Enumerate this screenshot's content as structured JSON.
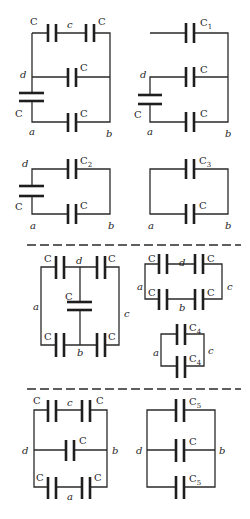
{
  "figure": {
    "type": "capacitor-network-reduction",
    "sections": [
      {
        "id": "section-1",
        "circuits": [
          {
            "id": "circuit-1",
            "labels": {
              "top_left_cap": "C",
              "top_node": "c",
              "top_right_cap": "C",
              "middle_cap": "C",
              "left_node": "d",
              "left_cap": "C",
              "bottom_cap": "C",
              "node_a": "a",
              "node_b": "b"
            }
          },
          {
            "id": "circuit-2",
            "labels": {
              "top_cap": "C",
              "top_cap_sub": "1",
              "left_node": "d",
              "middle_cap": "C",
              "left_cap": "C",
              "bottom_cap": "C",
              "node_a": "a",
              "node_b": "b"
            }
          },
          {
            "id": "circuit-3",
            "labels": {
              "left_node": "d",
              "top_cap": "C",
              "top_cap_sub": "2",
              "left_cap": "C",
              "bottom_cap": "C",
              "node_a": "a",
              "node_b": "b"
            }
          },
          {
            "id": "circuit-4",
            "labels": {
              "top_cap": "C",
              "top_cap_sub": "3",
              "bottom_cap": "C",
              "node_a": "a",
              "node_b": "b"
            }
          }
        ]
      },
      {
        "id": "section-2",
        "circuits": [
          {
            "id": "circuit-5",
            "labels": {
              "top_left_cap": "C",
              "top_node": "d",
              "top_right_cap": "C",
              "middle_cap": "C",
              "left_node": "a",
              "right_node": "c",
              "bottom_left_cap": "C",
              "bottom_node": "b",
              "bottom_right_cap": "C"
            }
          },
          {
            "id": "circuit-6",
            "labels": {
              "top_left_cap": "C",
              "top_node": "d",
              "top_right_cap": "C",
              "left_node": "a",
              "right_node": "c",
              "bottom_left_cap": "C",
              "bottom_node": "b",
              "bottom_right_cap": "C"
            }
          },
          {
            "id": "circuit-7",
            "labels": {
              "top_cap": "C",
              "top_cap_sub": "4",
              "bottom_cap": "C",
              "bottom_cap_sub": "4",
              "left_node": "a",
              "right_node": "c"
            }
          }
        ]
      },
      {
        "id": "section-3",
        "circuits": [
          {
            "id": "circuit-8",
            "labels": {
              "top_left_cap": "C",
              "top_node": "c",
              "top_right_cap": "C",
              "left_node": "d",
              "middle_cap": "C",
              "right_node": "b",
              "bottom_left_cap": "C",
              "bottom_node": "a",
              "bottom_right_cap": "C"
            }
          },
          {
            "id": "circuit-9",
            "labels": {
              "top_cap": "C",
              "top_cap_sub": "5",
              "left_node": "d",
              "middle_cap": "C",
              "right_node": "b",
              "bottom_cap": "C",
              "bottom_cap_sub": "5"
            }
          }
        ]
      }
    ],
    "colors": {
      "ink": "#1e1e1e",
      "background": "#ffffff"
    }
  }
}
